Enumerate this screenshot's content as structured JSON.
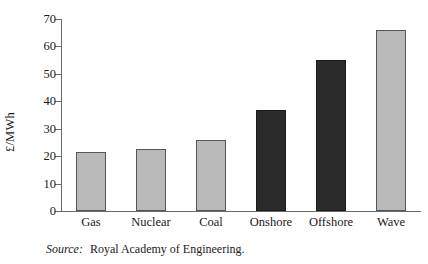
{
  "figure": {
    "ylabel": "£/MWh",
    "source_label": "Source:",
    "source_text": "Royal Academy of Engineering."
  },
  "colors": {
    "light_bar": "#b9b9b9",
    "dark_bar": "#2b2b2b",
    "axis": "#6a6a6a",
    "background": "#ffffff"
  },
  "chart_data": {
    "type": "bar",
    "title": "",
    "xlabel": "",
    "ylabel": "£/MWh",
    "ylim": [
      0,
      70
    ],
    "yticks": [
      0,
      10,
      20,
      30,
      40,
      50,
      60,
      70
    ],
    "ytick_labels": [
      "0",
      "10",
      "20",
      "30",
      "40",
      "50",
      "60",
      "70"
    ],
    "grid": false,
    "legend": "none",
    "categories": [
      "Gas",
      "Nuclear",
      "Coal",
      "Onshore",
      "Offshore",
      "Wave"
    ],
    "values": [
      21.5,
      22.5,
      26,
      37,
      55,
      66
    ],
    "bar_colors": [
      "light",
      "light",
      "light",
      "dark",
      "dark",
      "light"
    ]
  }
}
